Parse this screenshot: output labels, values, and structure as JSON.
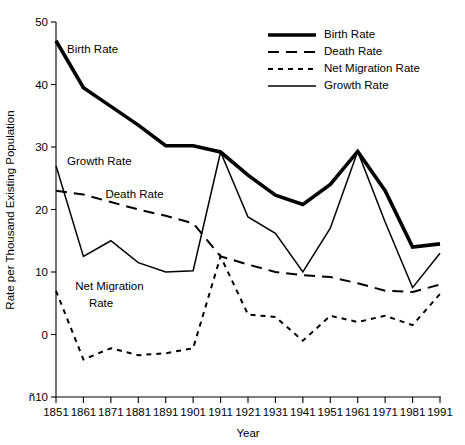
{
  "chart_data": {
    "type": "line",
    "title": "",
    "xlabel": "Year",
    "ylabel": "Rate per Thousand Existing Population",
    "x": [
      1851,
      1861,
      1871,
      1881,
      1891,
      1901,
      1911,
      1921,
      1931,
      1941,
      1951,
      1961,
      1971,
      1981,
      1991
    ],
    "xtick_labels": [
      "1851",
      "1861",
      "1871",
      "1881",
      "1891",
      "1901",
      "1911",
      "1921",
      "1931",
      "1941",
      "1951",
      "1961",
      "1971",
      "1981",
      "1991"
    ],
    "ytick_labels": [
      "50",
      "40",
      "30",
      "20",
      "10",
      "0",
      "ñ10"
    ],
    "ytick_values": [
      50,
      40,
      30,
      20,
      10,
      0,
      -10
    ],
    "xlim": [
      1851,
      1991
    ],
    "ylim": [
      -10,
      50
    ],
    "grid": false,
    "legend_position": "top-right",
    "series": [
      {
        "name": "Birth Rate",
        "style": "solid-thick",
        "values": [
          47.0,
          39.5,
          36.5,
          33.5,
          30.2,
          30.2,
          29.2,
          25.5,
          22.3,
          20.8,
          24.0,
          29.3,
          23.0,
          14.0,
          14.5
        ]
      },
      {
        "name": "Death Rate",
        "style": "long-dash",
        "values": [
          23.0,
          22.4,
          21.2,
          20.0,
          19.0,
          17.8,
          12.5,
          11.2,
          10.0,
          9.5,
          9.2,
          8.2,
          7.0,
          6.8,
          8.0
        ]
      },
      {
        "name": "Net Migration Rate",
        "style": "short-dash",
        "values": [
          7.0,
          -4.0,
          -2.2,
          -3.3,
          -3.0,
          -2.2,
          12.5,
          3.2,
          2.8,
          -1.0,
          3.0,
          2.0,
          3.0,
          1.5,
          6.5
        ]
      },
      {
        "name": "Growth Rate",
        "style": "solid-thin",
        "values": [
          27.0,
          12.5,
          15.0,
          11.5,
          10.0,
          10.2,
          29.2,
          18.8,
          16.2,
          10.0,
          17.0,
          29.3,
          18.0,
          7.5,
          13.0
        ]
      }
    ],
    "inline_annotations": [
      {
        "text": "Birth Rate",
        "x": 1855,
        "y": 45.0
      },
      {
        "text": "Growth Rate",
        "x": 1855,
        "y": 27.2
      },
      {
        "text": "Death Rate",
        "x": 1869,
        "y": 21.8
      },
      {
        "text": "Net Migration",
        "x": 1858,
        "y": 7.2
      },
      {
        "text": "Rate",
        "x": 1863,
        "y": 4.4
      }
    ],
    "legend": [
      {
        "label": "Birth Rate",
        "style": "solid-thick"
      },
      {
        "label": "Death Rate",
        "style": "long-dash"
      },
      {
        "label": "Net Migration Rate",
        "style": "short-dash"
      },
      {
        "label": "Growth Rate",
        "style": "solid-thin"
      }
    ],
    "colors": {
      "line": "#000000",
      "axis": "#000000",
      "background": "#ffffff"
    }
  },
  "caption": {
    "partial_text": ""
  }
}
